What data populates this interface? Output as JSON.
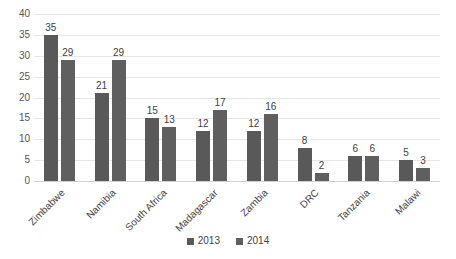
{
  "chart_data": {
    "type": "bar",
    "title": "",
    "subtitle": "",
    "xlabel": "",
    "ylabel": "",
    "ylim": [
      0,
      40
    ],
    "ytick_step": 5,
    "yticks": [
      40,
      35,
      30,
      25,
      20,
      15,
      10,
      5,
      0
    ],
    "grid": true,
    "legend_position": "bottom",
    "categories": [
      "Zimbabwe",
      "Namibia",
      "South Africa",
      "Madagascar",
      "Zambia",
      "DRC",
      "Tanzania",
      "Malawi"
    ],
    "series": [
      {
        "name": "2013",
        "color": "#595959",
        "values": [
          35,
          21,
          15,
          12,
          12,
          8,
          6,
          5
        ]
      },
      {
        "name": "2014",
        "color": "#5f5f5f",
        "values": [
          29,
          29,
          13,
          17,
          16,
          2,
          6,
          3
        ]
      }
    ],
    "data_labels": true
  },
  "legend": {
    "items": [
      {
        "label": "2013",
        "color": "#595959"
      },
      {
        "label": "2014",
        "color": "#5f5f5f"
      }
    ]
  },
  "colors": {
    "series_2013": "#595959",
    "series_2014": "#5f5f5f",
    "gridline": "#e6e6e6",
    "axis": "#d0d0d0",
    "text": "#3f3f3f",
    "background": "#ffffff"
  }
}
